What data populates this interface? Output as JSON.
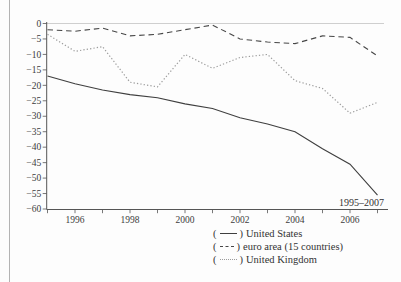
{
  "page": {
    "background": "#fdfdfd",
    "left_edge_color": "#b3b3b3"
  },
  "legend": {
    "paren_open": "(",
    "paren_close": ")"
  },
  "chart_data": {
    "type": "line",
    "title": "",
    "xlabel": "",
    "ylabel": "",
    "x": [
      1995,
      1996,
      1997,
      1998,
      1999,
      2000,
      2001,
      2002,
      2003,
      2004,
      2005,
      2006,
      2007
    ],
    "xtick_label_years": [
      1996,
      1998,
      2000,
      2002,
      2004,
      2006
    ],
    "ylim": [
      -60,
      0
    ],
    "ytick_step": 5,
    "grid": "zero-line-only",
    "annotation": "1995–2007",
    "legend_position": "bottom-center",
    "colors": {
      "axis": "#555555",
      "gridline": "#c9c9c9",
      "text": "#3c3c3c"
    },
    "series": [
      {
        "name": "United States",
        "style": "solid",
        "color": "#3f3f3f",
        "values": [
          -17,
          -19.5,
          -21.5,
          -23,
          -24,
          -26,
          -27.5,
          -30.5,
          -32.5,
          -35,
          -40.5,
          -45.5,
          -55.5
        ]
      },
      {
        "name": "euro area (15 countries)",
        "style": "dashed",
        "color": "#464646",
        "values": [
          -2,
          -2.5,
          -1.5,
          -4,
          -3.5,
          -2,
          -0.5,
          -5,
          -6,
          -6.5,
          -4,
          -4.5,
          -10.5
        ]
      },
      {
        "name": "United Kingdom",
        "style": "dotted",
        "color": "#9c9c9c",
        "values": [
          -3.5,
          -9,
          -7.5,
          -19,
          -20.5,
          -10,
          -14.5,
          -11,
          -10,
          -18.5,
          -21,
          -29,
          -25.5
        ]
      }
    ]
  }
}
